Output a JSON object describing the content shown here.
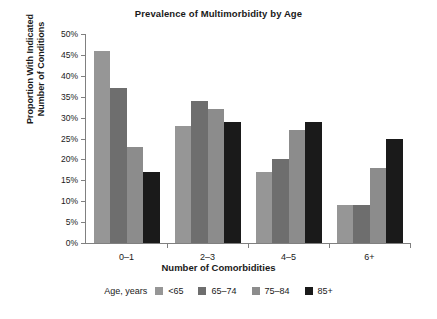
{
  "chart_data": {
    "type": "bar",
    "title": "Prevalence of Multimorbidity by Age",
    "xlabel": "Number of Comorbidities",
    "ylabel_line1": "Proportion With Indicated",
    "ylabel_line2": "Number of Conditions",
    "categories": [
      "0–1",
      "2–3",
      "4–5",
      "6+"
    ],
    "series": [
      {
        "name": "<65",
        "color": "#969696",
        "values": [
          46,
          28,
          17,
          9
        ]
      },
      {
        "name": "65–74",
        "color": "#6e6e6e",
        "values": [
          37,
          34,
          20,
          9
        ]
      },
      {
        "name": "75–84",
        "color": "#8c8c8c",
        "values": [
          23,
          32,
          27,
          18
        ]
      },
      {
        "name": "85+",
        "color": "#1a1a1a",
        "values": [
          17,
          29,
          29,
          25
        ]
      }
    ],
    "ylim": [
      0,
      50
    ],
    "ytick_values": [
      0,
      5,
      10,
      15,
      20,
      25,
      30,
      35,
      40,
      45,
      50
    ],
    "ytick_labels": [
      "0%",
      "5%",
      "10%",
      "15%",
      "20%",
      "25%",
      "30%",
      "35%",
      "40%",
      "45%",
      "50%"
    ],
    "grid": false,
    "legend_title": "Age, years",
    "legend_position": "bottom"
  }
}
